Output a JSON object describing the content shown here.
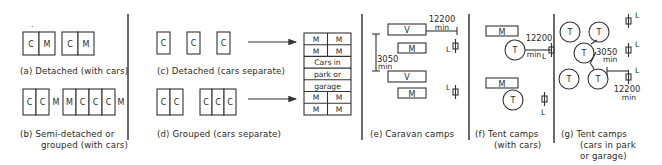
{
  "figure": {
    "colors": {
      "ink": "#2a2a2a",
      "background": "#ffffff"
    }
  },
  "panels": {
    "a": {
      "caption": "(a) Detached (with cars)",
      "units": [
        [
          "C",
          "M"
        ],
        [
          "C",
          "M"
        ]
      ]
    },
    "b": {
      "caption_line1": "(b) Semi-detached or",
      "caption_line2": "grouped (with cars)",
      "units": [
        [
          "C",
          "C"
        ],
        [
          "M"
        ],
        [
          "M",
          "C",
          "C",
          "C"
        ],
        [
          "M"
        ]
      ]
    },
    "c": {
      "caption": "(c) Detached (cars separate)",
      "units": [
        "C",
        "C",
        "C"
      ]
    },
    "d": {
      "caption": "(d) Grouped (cars separate)",
      "units": [
        [
          "C",
          "C"
        ],
        [
          "C",
          "C",
          "C"
        ]
      ]
    },
    "car_park": {
      "rows": [
        [
          "M",
          "M"
        ],
        [
          "M",
          "M"
        ],
        [
          "Cars in"
        ],
        [
          "park or"
        ],
        [
          "garage"
        ],
        [
          "M",
          "M"
        ],
        [
          "M",
          "M"
        ]
      ]
    },
    "e": {
      "caption": "(e) Caravan camps",
      "van_label": "V",
      "car_label": "M",
      "dim_horizontal": "12200",
      "dim_horizontal_unit": "min",
      "dim_vertical": "3050",
      "dim_vertical_unit": "min",
      "latrine_label": "L"
    },
    "f": {
      "caption_line1": "(f) Tent camps",
      "caption_line2": "(with cars)",
      "tent_label": "T",
      "car_label": "M",
      "dim_horizontal": "12200",
      "dim_horizontal_unit": "min",
      "latrine_label": "L"
    },
    "g": {
      "caption_line1": "(g) Tent camps",
      "caption_line2": "(cars in park",
      "caption_line3": "or garage)",
      "tent_label": "T",
      "dim_diagonal": "3050",
      "dim_diagonal_unit": "min",
      "dim_horizontal": "12200",
      "dim_horizontal_unit": "min",
      "latrine_label": "L"
    }
  }
}
